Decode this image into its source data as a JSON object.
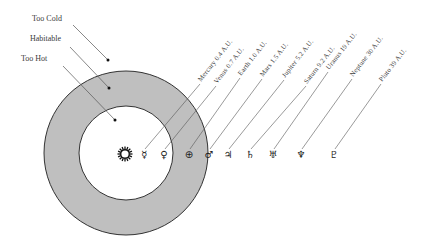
{
  "diagram": {
    "colors": {
      "background": "#ffffff",
      "habitable_ring": "#bfbfbf",
      "ring_stroke": "#333333",
      "line": "#555555"
    },
    "rings": {
      "center": [
        126,
        153
      ],
      "outer_radius": 82,
      "inner_radius": 47
    },
    "sun": {
      "icon": "sun-icon",
      "x": 125,
      "y": 154
    },
    "zones": [
      {
        "label": "Too Cold",
        "text_x": 32,
        "text_y": 21,
        "line": [
          73,
          25,
          108,
          60
        ]
      },
      {
        "label": "Habitable",
        "text_x": 30,
        "text_y": 41,
        "line": [
          70,
          47,
          109,
          88
        ]
      },
      {
        "label": "Too Hot",
        "text_x": 21,
        "text_y": 61,
        "line": [
          63,
          66,
          115,
          120
        ]
      }
    ],
    "planets": [
      {
        "name": "Mercury",
        "distance": "0.4 A.U.",
        "label": "Mercury 0.4 A.U.",
        "symbol": "☿",
        "icon": "mercury-symbol-icon",
        "x": 144,
        "y": 154,
        "lx": 201,
        "ly": 82
      },
      {
        "name": "Venus",
        "distance": "0.7 A.U.",
        "label": "Venus 0.7 A.U.",
        "symbol": "♀",
        "icon": "venus-symbol-icon",
        "x": 164,
        "y": 154,
        "lx": 217,
        "ly": 84
      },
      {
        "name": "Earth",
        "distance": "1.0 A.U.",
        "label": "Earth 1.0 A.U.",
        "symbol": "⊕",
        "icon": "earth-symbol-icon",
        "x": 189,
        "y": 154,
        "lx": 241,
        "ly": 76
      },
      {
        "name": "Mars",
        "distance": "1.5 A.U.",
        "label": "Mars 1.5 A.U.",
        "symbol": "♂",
        "icon": "mars-symbol-icon",
        "x": 209,
        "y": 154,
        "lx": 263,
        "ly": 77
      },
      {
        "name": "Jupiter",
        "distance": "5.2 A.U.",
        "label": "Jupiter 5.2 A.U.",
        "symbol": "♃",
        "icon": "jupiter-symbol-icon",
        "x": 228,
        "y": 154,
        "lx": 285,
        "ly": 78
      },
      {
        "name": "Saturn",
        "distance": "9.2 A.U.",
        "label": "Saturn 9.2 A.U.",
        "symbol": "♄",
        "icon": "saturn-symbol-icon",
        "x": 250,
        "y": 154,
        "lx": 307,
        "ly": 84
      },
      {
        "name": "Uranus",
        "distance": "19 A.U.",
        "label": "Uranus 19 A.U.",
        "symbol": "♅",
        "icon": "uranus-symbol-icon",
        "x": 273,
        "y": 154,
        "lx": 329,
        "ly": 70
      },
      {
        "name": "Neptune",
        "distance": "30 A.U.",
        "label": "Neptune 30 A.U.",
        "symbol": "♆",
        "icon": "neptune-symbol-icon",
        "x": 301,
        "y": 154,
        "lx": 353,
        "ly": 77
      },
      {
        "name": "Pluto",
        "distance": "39 A.U.",
        "label": "Pluto 39 A.U.",
        "symbol": "♇",
        "icon": "pluto-symbol-icon",
        "x": 334,
        "y": 154,
        "lx": 382,
        "ly": 82
      }
    ]
  }
}
